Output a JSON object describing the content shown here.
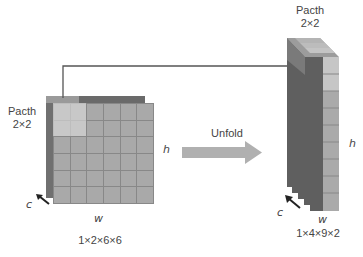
{
  "left": {
    "patch_label_line1": "Pacth",
    "patch_label_line2": "2×2",
    "h_label": "h",
    "w_label": "w",
    "c_label": "c",
    "shape": "1×2×6×6",
    "grid": {
      "rows": 6,
      "cols": 6,
      "patch_size": 2
    }
  },
  "arrow": {
    "label": "Unfold",
    "color": "#b0b0b0"
  },
  "right": {
    "patch_label_line1": "Pacth",
    "patch_label_line2": "2×2",
    "h_label": "h",
    "w_label": "w",
    "c_label": "c",
    "shape": "1×4×9×2",
    "cells": 9
  },
  "colors": {
    "cell": "#a9a9a9",
    "cell_highlight": "#c8c8c8",
    "back_layer": "#6e6e6e",
    "right_side": "#5f5f5f",
    "connector": "#555555"
  }
}
